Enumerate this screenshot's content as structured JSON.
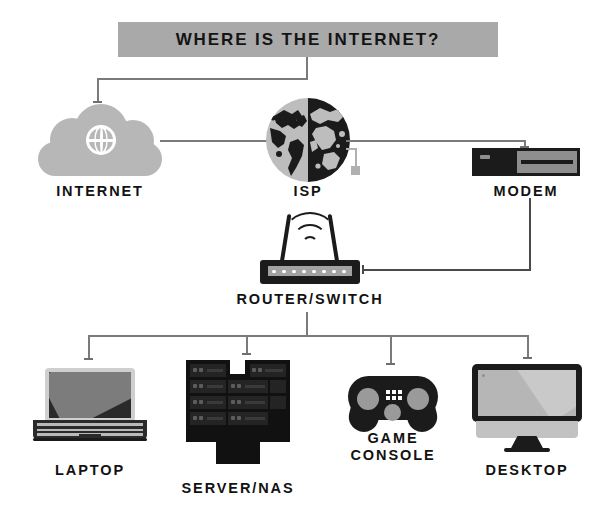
{
  "diagram": {
    "title": "WHERE IS THE INTERNET?",
    "banner_color": "#a9a9a9",
    "background_color": "#ffffff",
    "line_color": "#7b7b7b",
    "dark_color": "#1b1b1b",
    "gray_color": "#b7b7b7"
  },
  "nodes": {
    "internet": {
      "label": "INTERNET",
      "icon": "cloud-icon"
    },
    "isp": {
      "label": "ISP",
      "icon": "globe-icon"
    },
    "modem": {
      "label": "MODEM",
      "icon": "modem-icon"
    },
    "router": {
      "label": "ROUTER/SWITCH",
      "icon": "wifi-router-icon"
    },
    "laptop": {
      "label": "LAPTOP",
      "icon": "laptop-icon"
    },
    "server": {
      "label": "SERVER/NAS",
      "icon": "server-rack-icon"
    },
    "console": {
      "label": "GAME\nCONSOLE",
      "icon": "gamepad-icon"
    },
    "desktop": {
      "label": "DESKTOP",
      "icon": "desktop-monitor-icon"
    }
  },
  "connections": [
    {
      "from": "title",
      "to": "internet"
    },
    {
      "from": "internet",
      "to": "isp"
    },
    {
      "from": "isp",
      "to": "modem"
    },
    {
      "from": "modem",
      "to": "router"
    },
    {
      "from": "router",
      "to": "laptop"
    },
    {
      "from": "router",
      "to": "server"
    },
    {
      "from": "router",
      "to": "console"
    },
    {
      "from": "router",
      "to": "desktop"
    }
  ]
}
